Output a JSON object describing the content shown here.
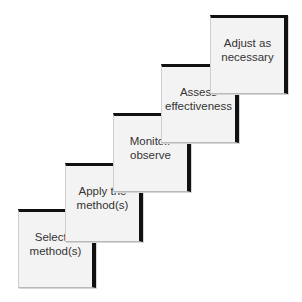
{
  "diagram": {
    "type": "staircase-process",
    "steps": [
      {
        "label": "Select a\nmethod(s)"
      },
      {
        "label": "Apply the\nmethod(s)"
      },
      {
        "label": "Monitor/\nobserve"
      },
      {
        "label": "Assess\neffectiveness"
      },
      {
        "label": "Adjust as\nnecessary"
      }
    ],
    "colors": {
      "box_fill": "#f3f3f3",
      "shadow": "#111111",
      "text": "#333333"
    }
  }
}
